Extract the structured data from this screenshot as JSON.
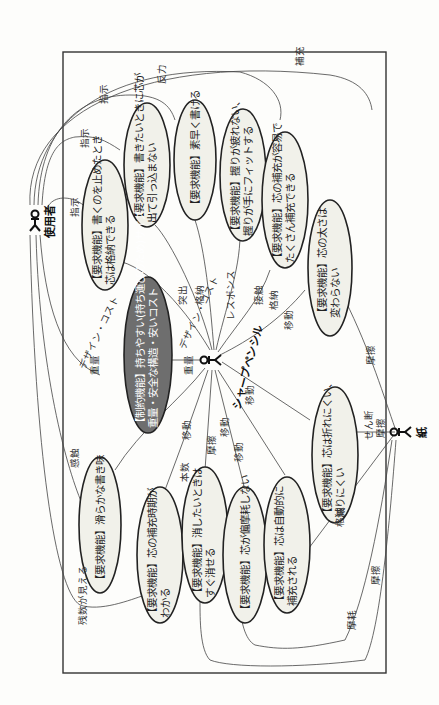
{
  "diagram": {
    "type": "use-case",
    "orientation": "rotated-90-cw",
    "colors": {
      "usecase_fill": "#f1f1ea",
      "constraint_fill": "#6e6e6e",
      "line": "#444444",
      "background": "#fdfdfb"
    },
    "actors": [
      {
        "id": "user",
        "name": "使用者"
      },
      {
        "id": "pencil",
        "name": "シャープペンシル"
      },
      {
        "id": "paper",
        "name": "紙"
      }
    ],
    "use_cases": [
      {
        "id": "uc1",
        "line1": "【要求機能】書くのを止めたとき",
        "line2": "芯は格納できる"
      },
      {
        "id": "uc2",
        "line1": "【要求機能】書きたいときに芯が",
        "line2": "出て引っ込まない"
      },
      {
        "id": "uc3",
        "line1": "【要求機能】素早く書ける",
        "line2": ""
      },
      {
        "id": "uc4",
        "line1": "【要求機能】握りが疲れない、",
        "line2": "握りが手にフィットする"
      },
      {
        "id": "uc5",
        "line1": "【要求機能】芯の補充が容易で",
        "line2": "たくさん補充できる"
      },
      {
        "id": "uc6",
        "line1": "【要求機能】芯の太さは",
        "line2": "変わらない"
      },
      {
        "id": "uc7",
        "line1": "【制約機能】持ちやすい(持ち運びのため)サイズ、",
        "line2": "重量・安全な構造・安いコスト",
        "constraint": true
      },
      {
        "id": "uc8",
        "line1": "【要求機能】芯は折れにくい、",
        "line2": "減りにくい"
      },
      {
        "id": "uc9",
        "line1": "【要求機能】滑らかな書き味",
        "line2": ""
      },
      {
        "id": "uc10",
        "line1": "【要求機能】芯の補充時期が",
        "line2": "わかる"
      },
      {
        "id": "uc11",
        "line1": "【要求機能】消したいときは",
        "line2": "すぐ消せる"
      },
      {
        "id": "uc12",
        "line1": "【要求機能】芯が偏摩耗しない",
        "line2": ""
      },
      {
        "id": "uc13",
        "line1": "【要求機能】芯は自動的に",
        "line2": "補充される"
      }
    ],
    "relation_labels": {
      "shiji": "指示",
      "hanryoku": "反力",
      "hoju": "補充",
      "kakuno": "格納",
      "response": "レスポンス",
      "setsuzoku": "接触",
      "tosshutsu": "突出",
      "idou": "移動",
      "design_cost": "デザイン・コスト",
      "juryo": "重量",
      "masatsu": "摩擦",
      "honsu": "本数",
      "kanshoku": "感触",
      "zansu": "残数が見える",
      "sendan": "せん断",
      "mamou": "摩耗"
    }
  }
}
